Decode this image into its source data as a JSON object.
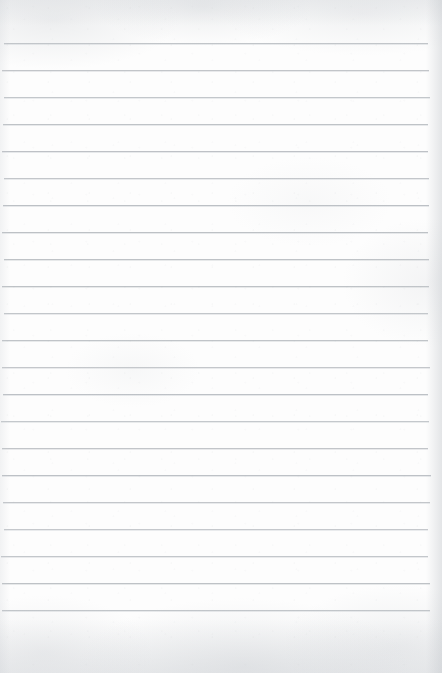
{
  "document": {
    "kind": "scanned-lined-paper",
    "title": "Blank ruled notebook page",
    "page_width": 442,
    "page_height": 673,
    "paper_color": "#fdfdfd",
    "rule_color": "#b9bdc2",
    "handwriting": "",
    "written_text": "",
    "header_text": "",
    "footer_text": "",
    "page_number": ""
  },
  "ruling": {
    "line_count": 22,
    "line_spacing_px": 27,
    "first_line_y": 43,
    "line_left_x": 3,
    "line_right_x": 429,
    "line_thickness_px": 1,
    "margin_line": "none",
    "top_margin_px": 43,
    "bottom_margin_px": 49,
    "lines_y": [
      43,
      70,
      97,
      124,
      151,
      178,
      205,
      232,
      259,
      286,
      313,
      340,
      367,
      394,
      421,
      448,
      475,
      502,
      529,
      556,
      583,
      610
    ],
    "line_contents": [
      "",
      "",
      "",
      "",
      "",
      "",
      "",
      "",
      "",
      "",
      "",
      "",
      "",
      "",
      "",
      "",
      "",
      "",
      "",
      "",
      "",
      ""
    ]
  }
}
